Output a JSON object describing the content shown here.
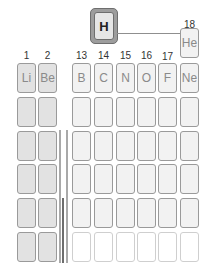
{
  "hydrogen": {
    "symbol": "H",
    "highlighted": true
  },
  "group_labels": [
    {
      "label": "1",
      "col": 0
    },
    {
      "label": "2",
      "col": 1
    },
    {
      "label": "13",
      "col": 2
    },
    {
      "label": "14",
      "col": 3
    },
    {
      "label": "15",
      "col": 4
    },
    {
      "label": "16",
      "col": 5
    },
    {
      "label": "17",
      "col": 6
    },
    {
      "label": "18",
      "col": 7
    }
  ],
  "helium": {
    "symbol": "He",
    "group": "18"
  },
  "period2": [
    "Li",
    "Be",
    "B",
    "C",
    "N",
    "O",
    "F",
    "Ne"
  ],
  "rows": 6,
  "s_block_columns": 2,
  "p_block_columns": 6,
  "colors": {
    "s_block_fill": "#e2e2e2",
    "p_block_fill": "#f2f2f2",
    "hydrogen_frame": "#9d9d9d",
    "transition_bar": "#a9a9a9",
    "inner_transition_bar": "#6d6d6d"
  }
}
